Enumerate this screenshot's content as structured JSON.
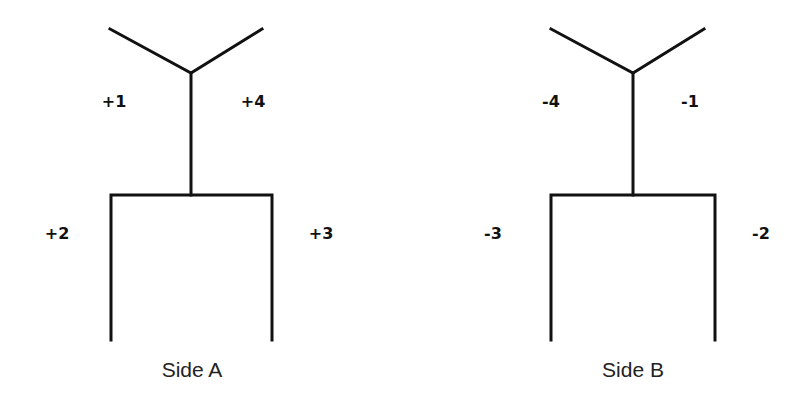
{
  "diagram": {
    "stroke_color": "#111111",
    "sides": [
      {
        "caption": "Side A",
        "labels": {
          "upper_left": "+1",
          "upper_right": "+4",
          "lower_left": "+2",
          "lower_right": "+3"
        }
      },
      {
        "caption": "Side B",
        "labels": {
          "upper_left": "-4",
          "upper_right": "-1",
          "lower_left": "-3",
          "lower_right": "-2"
        }
      }
    ]
  }
}
